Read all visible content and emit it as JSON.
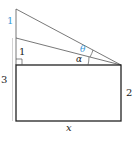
{
  "diagram": {
    "labels": {
      "top_segment": "1",
      "middle_segment": "1",
      "left_side": "3",
      "right_side": "2",
      "bottom_side": "x",
      "angle_theta": "θ",
      "angle_alpha": "α"
    },
    "colors": {
      "accent": "#3a9ad9",
      "line": "#2b2b2b",
      "faint": "#bdbdbd"
    }
  }
}
